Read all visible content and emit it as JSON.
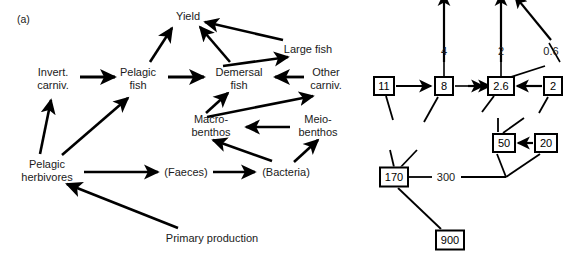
{
  "figure": {
    "panel_tag": "(a)",
    "background": "#ffffff",
    "ink": "#000000",
    "width": 572,
    "height": 268
  },
  "food_web": {
    "title": "Marine food web flow diagram",
    "nodes": [
      {
        "id": "yield",
        "label": "Yield",
        "x": 188,
        "y": 16,
        "lines": [
          "Yield"
        ]
      },
      {
        "id": "large-fish",
        "label": "Large fish",
        "x": 308,
        "y": 49,
        "lines": [
          "Large fish"
        ]
      },
      {
        "id": "invert-carniv",
        "label": "Invert. carniv.",
        "x": 53,
        "y": 78,
        "lines": [
          "Invert.",
          "carniv."
        ]
      },
      {
        "id": "pelagic-fish",
        "label": "Pelagic fish",
        "x": 138,
        "y": 78,
        "lines": [
          "Pelagic",
          "fish"
        ]
      },
      {
        "id": "demersal-fish",
        "label": "Demersal fish",
        "x": 239,
        "y": 78,
        "lines": [
          "Demersal",
          "fish"
        ]
      },
      {
        "id": "other-carniv",
        "label": "Other carniv.",
        "x": 326,
        "y": 78,
        "lines": [
          "Other",
          "carniv."
        ]
      },
      {
        "id": "macro-benthos",
        "label": "Macro-benthos",
        "x": 211,
        "y": 125,
        "lines": [
          "Macro-",
          "benthos"
        ]
      },
      {
        "id": "meio-benthos",
        "label": "Meio-benthos",
        "x": 318,
        "y": 125,
        "lines": [
          "Meio-",
          "benthos"
        ]
      },
      {
        "id": "pelagic-herb",
        "label": "Pelagic herbivores",
        "x": 47,
        "y": 170,
        "lines": [
          "Pelagic",
          "herbivores"
        ]
      },
      {
        "id": "faeces",
        "label": "(Faeces)",
        "x": 186,
        "y": 172,
        "lines": [
          "(Faeces)"
        ]
      },
      {
        "id": "bacteria",
        "label": "(Bacteria)",
        "x": 286,
        "y": 172,
        "lines": [
          "(Bacteria)"
        ]
      },
      {
        "id": "primary-prod",
        "label": "Primary production",
        "x": 212,
        "y": 238,
        "lines": [
          "Primary production"
        ]
      }
    ],
    "edges": [
      {
        "from": "pelagic-fish",
        "to": "yield"
      },
      {
        "from": "demersal-fish",
        "to": "yield"
      },
      {
        "from": "large-fish",
        "to": "yield"
      },
      {
        "from": "demersal-fish",
        "to": "large-fish"
      },
      {
        "from": "invert-carniv",
        "to": "pelagic-fish"
      },
      {
        "from": "pelagic-fish",
        "to": "demersal-fish"
      },
      {
        "from": "other-carniv",
        "to": "demersal-fish"
      },
      {
        "from": "macro-benthos",
        "to": "demersal-fish"
      },
      {
        "from": "macro-benthos",
        "to": "other-carniv"
      },
      {
        "from": "meio-benthos",
        "to": "macro-benthos"
      },
      {
        "from": "pelagic-herb",
        "to": "invert-carniv"
      },
      {
        "from": "pelagic-herb",
        "to": "pelagic-fish"
      },
      {
        "from": "pelagic-herb",
        "to": "faeces"
      },
      {
        "from": "faeces",
        "to": "bacteria"
      },
      {
        "from": "bacteria",
        "to": "macro-benthos"
      },
      {
        "from": "bacteria",
        "to": "meio-benthos"
      },
      {
        "from": "primary-prod",
        "to": "pelagic-herb"
      }
    ]
  },
  "flow_quantities": {
    "title": "Quantified flow / biomass diagram",
    "boxes": [
      {
        "id": "box-11",
        "value": "11",
        "x": 384,
        "y": 86,
        "w": 22,
        "h": 20
      },
      {
        "id": "box-8",
        "value": "8",
        "x": 444,
        "y": 86,
        "w": 20,
        "h": 20
      },
      {
        "id": "box-26",
        "value": "2.6",
        "x": 501,
        "y": 86,
        "w": 28,
        "h": 20
      },
      {
        "id": "box-2",
        "value": "2",
        "x": 553,
        "y": 86,
        "w": 20,
        "h": 20
      },
      {
        "id": "box-50",
        "value": "50",
        "x": 504,
        "y": 143,
        "w": 24,
        "h": 20
      },
      {
        "id": "box-20",
        "value": "20",
        "x": 546,
        "y": 143,
        "w": 24,
        "h": 20
      },
      {
        "id": "box-170",
        "value": "170",
        "x": 394,
        "y": 177,
        "w": 30,
        "h": 21
      },
      {
        "id": "box-900",
        "value": "900",
        "x": 450,
        "y": 240,
        "w": 30,
        "h": 21
      }
    ],
    "flow_labels": [
      {
        "id": "flow-4",
        "value": "4",
        "x": 444,
        "y": 51
      },
      {
        "id": "flow-2",
        "value": "2",
        "x": 501,
        "y": 51
      },
      {
        "id": "flow-06",
        "value": "0.6",
        "x": 551,
        "y": 51
      },
      {
        "id": "flow-300",
        "value": "300",
        "x": 446,
        "y": 177
      }
    ]
  }
}
